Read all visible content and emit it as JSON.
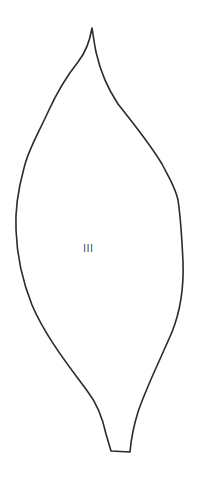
{
  "figure": {
    "type": "leaf-outline-drawing",
    "shape_label": "III",
    "colors": {
      "background": "#ffffff",
      "stroke": "#2a2a2a",
      "label": "#555555"
    }
  }
}
